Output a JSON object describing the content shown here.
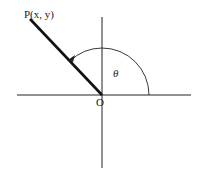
{
  "diagram": {
    "point_label": "P(x, y)",
    "origin_label": "O",
    "angle_label": "θ",
    "colors": {
      "stroke": "#222222",
      "background": "#ffffff"
    }
  }
}
